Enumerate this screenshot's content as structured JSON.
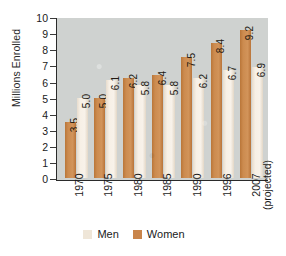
{
  "chart_data": {
    "type": "bar",
    "title": "",
    "xlabel": "",
    "ylabel": "Millions Enrolled",
    "ylim": [
      0,
      10
    ],
    "yticks": [
      "10",
      "9",
      "8",
      "7",
      "6",
      "5",
      "4",
      "3",
      "2",
      "1",
      "0"
    ],
    "grid": false,
    "legend_position": "bottom",
    "categories": [
      "1970",
      "1975",
      "1980",
      "1985",
      "1990",
      "1996",
      "2007"
    ],
    "category_notes": [
      "",
      "",
      "",
      "",
      "",
      "",
      "(projected)"
    ],
    "series": [
      {
        "name": "Women",
        "color": "#c9854b",
        "values": [
          3.5,
          5.0,
          6.2,
          6.4,
          7.5,
          8.4,
          9.2
        ],
        "labels": [
          "3.5",
          "5.0",
          "6.2",
          "6.4",
          "7.5",
          "8.4",
          "9.2"
        ]
      },
      {
        "name": "Men",
        "color": "#efe6d8",
        "values": [
          5.0,
          6.1,
          5.8,
          5.8,
          6.2,
          6.7,
          6.9
        ],
        "labels": [
          "5.0",
          "6.1",
          "5.8",
          "5.8",
          "6.2",
          "6.7",
          "6.9"
        ]
      }
    ],
    "plot_background": "#cfd2d0",
    "axis_color": "#2b2b2b"
  },
  "legend": {
    "items": [
      {
        "label": "Men",
        "color": "#efe6d8"
      },
      {
        "label": "Women",
        "color": "#c9854b"
      }
    ]
  }
}
